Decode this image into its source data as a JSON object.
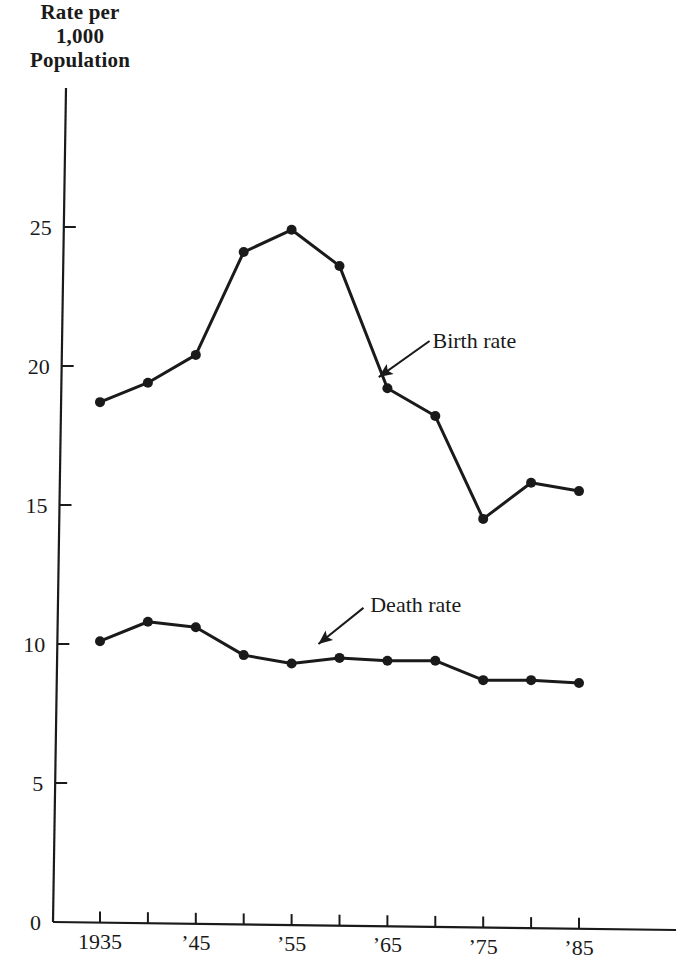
{
  "chart_data": {
    "type": "line",
    "title": "",
    "xlabel": "",
    "ylabel": "Rate per 1,000 Population",
    "ylabel_lines": [
      "Rate per",
      "1,000",
      "Population"
    ],
    "x": [
      1935,
      1940,
      1945,
      1950,
      1955,
      1960,
      1965,
      1970,
      1975,
      1980,
      1985
    ],
    "x_ticks": [
      1935,
      1940,
      1945,
      1950,
      1955,
      1960,
      1965,
      1970,
      1975,
      1980,
      1985
    ],
    "x_tick_labels": [
      {
        "x": 1935,
        "label": "1935"
      },
      {
        "x": 1945,
        "label": "’45"
      },
      {
        "x": 1955,
        "label": "’55"
      },
      {
        "x": 1965,
        "label": "’65"
      },
      {
        "x": 1975,
        "label": "’75"
      },
      {
        "x": 1985,
        "label": "’85"
      }
    ],
    "y_ticks": [
      0,
      5,
      10,
      15,
      20,
      25
    ],
    "y_tick_labels": [
      "0",
      "5",
      "10",
      "15",
      "20",
      "25"
    ],
    "ylim": [
      0,
      30
    ],
    "xlim": [
      1931.7,
      1993.5
    ],
    "grid": false,
    "legend": "none (inline annotations with arrows)",
    "series": [
      {
        "name": "Birth rate",
        "values": [
          18.7,
          19.4,
          20.4,
          24.1,
          24.9,
          23.6,
          19.2,
          18.2,
          14.5,
          15.8,
          15.5
        ],
        "annotation": {
          "label": "Birth rate",
          "label_x": 1969.5,
          "label_y": 20.9,
          "arrow_from_x": 1969.4,
          "arrow_from_y": 20.9,
          "arrow_to_x": 1964.1,
          "arrow_to_y": 19.6
        }
      },
      {
        "name": "Death rate",
        "values": [
          10.1,
          10.8,
          10.6,
          9.6,
          9.3,
          9.5,
          9.4,
          9.4,
          8.7,
          8.7,
          8.6
        ],
        "annotation": {
          "label": "Death rate",
          "label_x": 1963.0,
          "label_y": 11.4,
          "arrow_from_x": 1962.5,
          "arrow_from_y": 11.3,
          "arrow_to_x": 1957.8,
          "arrow_to_y": 10.0
        }
      }
    ]
  }
}
